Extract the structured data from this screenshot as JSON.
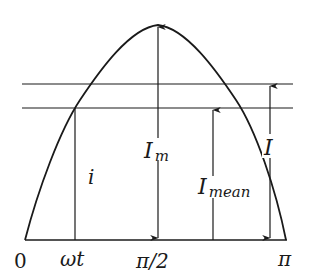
{
  "diagram": {
    "type": "half-sine current waveform with mean and effective value",
    "colors": {
      "stroke": "#1a1a1a",
      "background": "#ffffff"
    },
    "x_axis": {
      "tick_labels": [
        "0",
        "ωt",
        "π/2",
        "π"
      ]
    },
    "levels": {
      "effective": {
        "symbol": "I"
      },
      "mean": {
        "symbol": "I",
        "subscript": "mean"
      },
      "peak": {
        "symbol": "I",
        "subscript": "m"
      },
      "instantaneous": {
        "symbol": "i"
      }
    }
  }
}
